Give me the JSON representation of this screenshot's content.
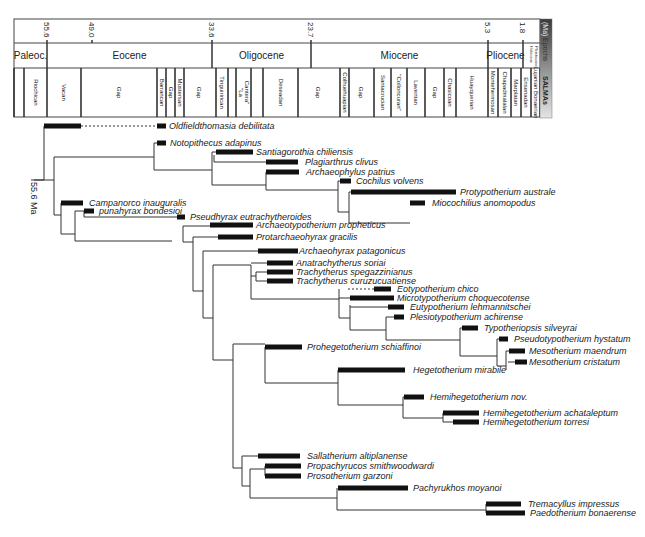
{
  "chart_data": {
    "type": "phylogeny",
    "title": "",
    "axis": {
      "label": "(Ma)",
      "ticks": [
        {
          "label": "55.6",
          "x": 47
        },
        {
          "label": "49.0",
          "x": 92
        },
        {
          "label": "33.6",
          "x": 212
        },
        {
          "label": "23.7",
          "x": 311
        },
        {
          "label": "5.3",
          "x": 488
        },
        {
          "label": "1.8",
          "x": 523
        }
      ]
    },
    "side_labels": {
      "ma": "(Ma)",
      "epochs": "Epochs",
      "salmas": "SALMAs"
    },
    "epochs": [
      {
        "label": "Paleoc.",
        "x0": 14,
        "x1": 47
      },
      {
        "label": "Eocene",
        "x0": 47,
        "x1": 212
      },
      {
        "label": "Oligocene",
        "x0": 212,
        "x1": 311
      },
      {
        "label": "Miocene",
        "x0": 311,
        "x1": 488
      },
      {
        "label": "Pliocene",
        "x0": 488,
        "x1": 523
      },
      {
        "label": "Holocene Pleistocene",
        "x0": 523,
        "x1": 540
      }
    ],
    "salmas": [
      {
        "label": "",
        "x0": 14,
        "x1": 24
      },
      {
        "label": "Riochican",
        "x0": 24,
        "x1": 47
      },
      {
        "label": "Vacan",
        "x0": 47,
        "x1": 81
      },
      {
        "label": "Gap",
        "x0": 81,
        "x1": 157
      },
      {
        "label": "Barrancan",
        "x0": 157,
        "x1": 166
      },
      {
        "label": "Gap",
        "x0": 166,
        "x1": 175
      },
      {
        "label": "Mustersan",
        "x0": 175,
        "x1": 184
      },
      {
        "label": "Gap",
        "x0": 184,
        "x1": 214
      },
      {
        "label": "Tinguirirican",
        "x0": 216,
        "x1": 228
      },
      {
        "label": "",
        "x0": 228,
        "x1": 236
      },
      {
        "label": "\"La Cantera\"",
        "x0": 236,
        "x1": 251
      },
      {
        "label": "",
        "x0": 251,
        "x1": 263
      },
      {
        "label": "Deseadan",
        "x0": 263,
        "x1": 298
      },
      {
        "label": "Gap",
        "x0": 298,
        "x1": 338
      },
      {
        "label": "Colhuehuapian",
        "x0": 340,
        "x1": 349
      },
      {
        "label": "Gap",
        "x0": 349,
        "x1": 372
      },
      {
        "label": "Santacrucian",
        "x0": 374,
        "x1": 391
      },
      {
        "label": "\"Colloncuran\"",
        "x0": 391,
        "x1": 407
      },
      {
        "label": "Laventan",
        "x0": 407,
        "x1": 425
      },
      {
        "label": "Gap",
        "x0": 425,
        "x1": 444
      },
      {
        "label": "Chasicoan",
        "x0": 444,
        "x1": 456
      },
      {
        "label": "Huayquerian",
        "x0": 456,
        "x1": 488
      },
      {
        "label": "Montehermosan",
        "x0": 488,
        "x1": 498
      },
      {
        "label": "Chapadmalalan",
        "x0": 498,
        "x1": 511
      },
      {
        "label": "Marplatan",
        "x0": 511,
        "x1": 521
      },
      {
        "label": "Ensenadan",
        "x0": 521,
        "x1": 531
      },
      {
        "label": "Lujanian Bonaerian",
        "x0": 531,
        "x1": 540
      }
    ],
    "node_annotation": {
      "label": "55.6 Ma"
    },
    "taxa": [
      {
        "name": "Oldfieldthomasia debilitata",
        "y": 126,
        "bar": [
          44,
          81
        ],
        "ghost": [
          81,
          157
        ],
        "bar2": [
          157,
          166
        ],
        "label_x": 169
      },
      {
        "name": "Notopithecus adapinus",
        "y": 143,
        "bar": [
          157,
          166
        ],
        "label_x": 170
      },
      {
        "name": "Santiagorothia chiliensis",
        "y": 152,
        "bar": [
          216,
          253
        ],
        "label_x": 256
      },
      {
        "name": "Plagiarthrus clivus",
        "y": 162,
        "bar": [
          266,
          298
        ],
        "label_x": 305
      },
      {
        "name": "Archaeophylus patrius",
        "y": 172,
        "bar": [
          266,
          299
        ],
        "label_x": 306
      },
      {
        "name": "Cochilus volvens",
        "y": 181,
        "bar": [
          340,
          351
        ],
        "label_x": 356
      },
      {
        "name": "Protypotherium australe",
        "y": 192,
        "bar": [
          351,
          456
        ],
        "label_x": 460
      },
      {
        "name": "Miocochilius anomopodus",
        "y": 203,
        "bar": [
          410,
          425
        ],
        "label_x": 432
      },
      {
        "name": "Campanorco inauguralis",
        "y": 203,
        "bar": [
          61,
          83
        ],
        "label_x": 89
      },
      {
        "name": "punahyrax bondesioi",
        "y": 211,
        "bar": [
          84,
          94
        ],
        "label_x": 99
      },
      {
        "name": "Pseudhyrax eutrachytheroides",
        "y": 217,
        "bar": [
          177,
          185
        ],
        "label_x": 190
      },
      {
        "name": "Archaeotypotherium propheticus",
        "y": 225,
        "bar": [
          210,
          253
        ],
        "label_x": 256
      },
      {
        "name": "Protarchaeohyrax gracilis",
        "y": 237,
        "bar": [
          218,
          253
        ],
        "label_x": 256
      },
      {
        "name": "Archaeohyrax patagonicus",
        "y": 251,
        "bar": [
          258,
          298
        ],
        "label_x": 299
      },
      {
        "name": "Anatrachytherus soriai",
        "y": 263,
        "bar": [
          267,
          293
        ],
        "label_x": 296
      },
      {
        "name": "Trachytherus spegazzinianus",
        "y": 272,
        "bar": [
          267,
          293
        ],
        "label_x": 296
      },
      {
        "name": "Trachytherus curuzucuatiense",
        "y": 281,
        "bar": [
          267,
          293
        ],
        "label_x": 296
      },
      {
        "name": "Eotypotherium chico",
        "y": 289,
        "bar": [
          374,
          391
        ],
        "ghost": [
          348,
          374
        ],
        "label_x": 397
      },
      {
        "name": "Microtypotherium choquecotense",
        "y": 298,
        "bar": [
          350,
          394
        ],
        "label_x": 397
      },
      {
        "name": "Eutypotherium lehmannitschei",
        "y": 307,
        "bar": [
          388,
          404
        ],
        "label_x": 410
      },
      {
        "name": "Plesiotypotherium achirense",
        "y": 317,
        "bar": [
          394,
          404
        ],
        "label_x": 410
      },
      {
        "name": "Typotheriopsis silveyrai",
        "y": 328,
        "bar": [
          462,
          478
        ],
        "label_x": 484
      },
      {
        "name": "Pseudotypotherium hystatum",
        "y": 339,
        "bar": [
          499,
          508
        ],
        "label_x": 514
      },
      {
        "name": "Mesotherium maendrum",
        "y": 351,
        "bar": [
          509,
          525
        ],
        "label_x": 529
      },
      {
        "name": "Mesotherium cristatum",
        "y": 362,
        "bar": [
          515,
          527
        ],
        "label_x": 529
      },
      {
        "name": "Prohegetotherium schiaffinoi",
        "y": 347,
        "bar": [
          265,
          302
        ],
        "label_x": 307
      },
      {
        "name": "Hegetotherium mirabile",
        "y": 370,
        "bar": [
          338,
          405
        ],
        "label_x": 413
      },
      {
        "name": "Hemihegetotherium nov.",
        "y": 397,
        "bar": [
          404,
          424
        ],
        "label_x": 430
      },
      {
        "name": "Hemihegetotherium achataleptum",
        "y": 413,
        "bar": [
          443,
          479
        ],
        "label_x": 483
      },
      {
        "name": "Hemihegetotherium torresi",
        "y": 422,
        "bar": [
          453,
          479
        ],
        "label_x": 483
      },
      {
        "name": "Sallatherium altiplanense",
        "y": 456,
        "bar": [
          258,
          300
        ],
        "label_x": 307
      },
      {
        "name": "Propachyrucos smithwoodwardi",
        "y": 466,
        "bar": [
          265,
          301
        ],
        "label_x": 307
      },
      {
        "name": "Prosotherium garzoni",
        "y": 476,
        "bar": [
          265,
          301
        ],
        "label_x": 307
      },
      {
        "name": "Pachyrukhos moyanoi",
        "y": 488,
        "bar": [
          338,
          408
        ],
        "label_x": 413
      },
      {
        "name": "Tremacyllus impressus",
        "y": 504,
        "bar": [
          486,
          521
        ],
        "label_x": 528
      },
      {
        "name": "Paedotherium bonaerense",
        "y": 513,
        "bar": [
          486,
          525
        ],
        "label_x": 530
      }
    ],
    "branches": [
      [
        [
          44,
          126
        ],
        [
          44,
          180
        ]
      ],
      [
        [
          34,
          180
        ],
        [
          44,
          180
        ]
      ],
      [
        [
          44,
          180
        ],
        [
          54,
          180
        ]
      ],
      [
        [
          54,
          180
        ],
        [
          54,
          157
        ]
      ],
      [
        [
          54,
          157
        ],
        [
          154,
          157
        ]
      ],
      [
        [
          54,
          180
        ],
        [
          54,
          215
        ]
      ],
      [
        [
          154,
          143
        ],
        [
          154,
          170
        ]
      ],
      [
        [
          154,
          143
        ],
        [
          157,
          143
        ]
      ],
      [
        [
          154,
          170
        ],
        [
          212,
          170
        ]
      ],
      [
        [
          212,
          152
        ],
        [
          212,
          170
        ]
      ],
      [
        [
          212,
          152
        ],
        [
          216,
          152
        ]
      ],
      [
        [
          212,
          170
        ],
        [
          212,
          185
        ]
      ],
      [
        [
          214,
          155
        ],
        [
          214,
          162
        ]
      ],
      [
        [
          214,
          162
        ],
        [
          266,
          162
        ]
      ],
      [
        [
          212,
          185
        ],
        [
          266,
          185
        ]
      ],
      [
        [
          266,
          172
        ],
        [
          266,
          190
        ]
      ],
      [
        [
          266,
          190
        ],
        [
          338,
          190
        ]
      ],
      [
        [
          338,
          181
        ],
        [
          338,
          212
        ]
      ],
      [
        [
          338,
          181
        ],
        [
          340,
          181
        ]
      ],
      [
        [
          338,
          212
        ],
        [
          349,
          212
        ]
      ],
      [
        [
          349,
          192
        ],
        [
          349,
          223
        ]
      ],
      [
        [
          349,
          192
        ],
        [
          351,
          192
        ]
      ],
      [
        [
          349,
          223
        ],
        [
          410,
          223
        ]
      ],
      [
        [
          54,
          215
        ],
        [
          61,
          215
        ]
      ],
      [
        [
          61,
          203
        ],
        [
          61,
          234
        ]
      ],
      [
        [
          61,
          203
        ],
        [
          62,
          203
        ]
      ],
      [
        [
          61,
          234
        ],
        [
          75,
          234
        ]
      ],
      [
        [
          75,
          211
        ],
        [
          75,
          241
        ]
      ],
      [
        [
          75,
          211
        ],
        [
          84,
          211
        ]
      ],
      [
        [
          75,
          241
        ],
        [
          172,
          241
        ]
      ],
      [
        [
          84,
          211
        ],
        [
          84,
          217
        ]
      ],
      [
        [
          84,
          217
        ],
        [
          177,
          217
        ]
      ],
      [
        [
          183,
          226
        ],
        [
          183,
          242
        ]
      ],
      [
        [
          183,
          226
        ],
        [
          210,
          226
        ]
      ],
      [
        [
          183,
          242
        ],
        [
          193,
          242
        ]
      ],
      [
        [
          193,
          237
        ],
        [
          193,
          291
        ]
      ],
      [
        [
          193,
          237
        ],
        [
          218,
          237
        ]
      ],
      [
        [
          193,
          291
        ],
        [
          203,
          291
        ]
      ],
      [
        [
          203,
          251
        ],
        [
          203,
          318
        ]
      ],
      [
        [
          203,
          251
        ],
        [
          258,
          251
        ]
      ],
      [
        [
          203,
          318
        ],
        [
          213,
          318
        ]
      ],
      [
        [
          213,
          265
        ],
        [
          213,
          360
        ]
      ],
      [
        [
          213,
          265
        ],
        [
          251,
          265
        ]
      ],
      [
        [
          251,
          265
        ],
        [
          251,
          299
        ]
      ],
      [
        [
          251,
          263
        ],
        [
          267,
          263
        ]
      ],
      [
        [
          251,
          276
        ],
        [
          256,
          276
        ]
      ],
      [
        [
          256,
          272
        ],
        [
          256,
          281
        ]
      ],
      [
        [
          256,
          272
        ],
        [
          267,
          272
        ]
      ],
      [
        [
          256,
          281
        ],
        [
          267,
          281
        ]
      ],
      [
        [
          251,
          299
        ],
        [
          339,
          299
        ]
      ],
      [
        [
          339,
          289
        ],
        [
          339,
          318
        ]
      ],
      [
        [
          339,
          298
        ],
        [
          350,
          298
        ]
      ],
      [
        [
          339,
          318
        ],
        [
          350,
          318
        ]
      ],
      [
        [
          350,
          305
        ],
        [
          350,
          330
        ]
      ],
      [
        [
          350,
          307
        ],
        [
          388,
          307
        ]
      ],
      [
        [
          350,
          330
        ],
        [
          386,
          330
        ]
      ],
      [
        [
          386,
          317
        ],
        [
          386,
          340
        ]
      ],
      [
        [
          386,
          317
        ],
        [
          394,
          317
        ]
      ],
      [
        [
          386,
          340
        ],
        [
          460,
          340
        ]
      ],
      [
        [
          460,
          328
        ],
        [
          460,
          356
        ]
      ],
      [
        [
          460,
          328
        ],
        [
          462,
          328
        ]
      ],
      [
        [
          460,
          356
        ],
        [
          497,
          356
        ]
      ],
      [
        [
          497,
          339
        ],
        [
          497,
          366
        ]
      ],
      [
        [
          497,
          339
        ],
        [
          499,
          339
        ]
      ],
      [
        [
          497,
          366
        ],
        [
          506,
          366
        ]
      ],
      [
        [
          506,
          351
        ],
        [
          506,
          370
        ]
      ],
      [
        [
          506,
          351
        ],
        [
          509,
          351
        ]
      ],
      [
        [
          508,
          362
        ],
        [
          515,
          362
        ]
      ],
      [
        [
          213,
          360
        ],
        [
          233,
          360
        ]
      ],
      [
        [
          233,
          344
        ],
        [
          233,
          468
        ]
      ],
      [
        [
          233,
          344
        ],
        [
          265,
          344
        ]
      ],
      [
        [
          265,
          347
        ],
        [
          265,
          383
        ]
      ],
      [
        [
          265,
          383
        ],
        [
          338,
          383
        ]
      ],
      [
        [
          338,
          370
        ],
        [
          338,
          405
        ]
      ],
      [
        [
          338,
          405
        ],
        [
          403,
          405
        ]
      ],
      [
        [
          403,
          397
        ],
        [
          403,
          418
        ]
      ],
      [
        [
          403,
          397
        ],
        [
          404,
          397
        ]
      ],
      [
        [
          403,
          418
        ],
        [
          443,
          418
        ]
      ],
      [
        [
          443,
          413
        ],
        [
          443,
          422
        ]
      ],
      [
        [
          443,
          422
        ],
        [
          453,
          422
        ]
      ],
      [
        [
          233,
          468
        ],
        [
          242,
          468
        ]
      ],
      [
        [
          242,
          456
        ],
        [
          242,
          486
        ]
      ],
      [
        [
          242,
          456
        ],
        [
          258,
          456
        ]
      ],
      [
        [
          242,
          486
        ],
        [
          250,
          486
        ]
      ],
      [
        [
          250,
          469
        ],
        [
          250,
          498
        ]
      ],
      [
        [
          250,
          469
        ],
        [
          265,
          469
        ]
      ],
      [
        [
          265,
          466
        ],
        [
          265,
          476
        ]
      ],
      [
        [
          250,
          498
        ],
        [
          337,
          498
        ]
      ],
      [
        [
          337,
          488
        ],
        [
          337,
          510
        ]
      ],
      [
        [
          337,
          510
        ],
        [
          486,
          510
        ]
      ],
      [
        [
          486,
          504
        ],
        [
          486,
          513
        ]
      ]
    ]
  }
}
